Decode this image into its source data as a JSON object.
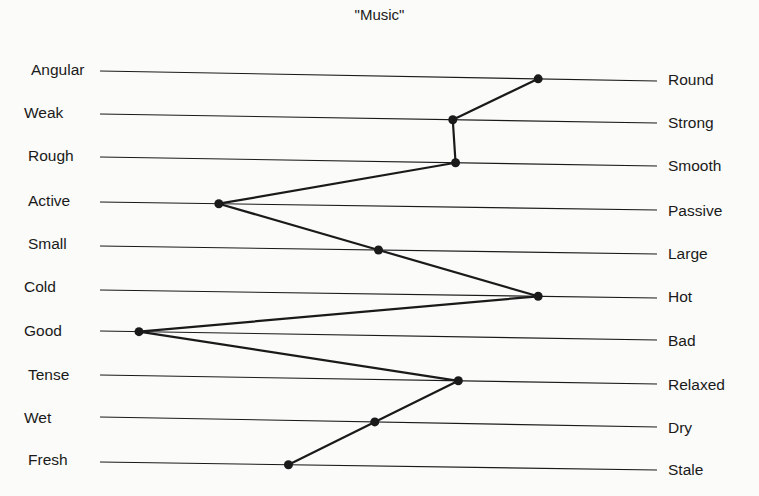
{
  "chart_data": {
    "type": "line",
    "subtype": "semantic-differential-profile",
    "title": "\"Music\"",
    "scale_points": 7,
    "xlim": [
      1,
      7
    ],
    "xlabel": "",
    "ylabel": "",
    "grid": false,
    "legend": null,
    "scales": [
      {
        "left": "Angular",
        "right": "Round",
        "value": 5.72
      },
      {
        "left": "Weak",
        "right": "Strong",
        "value": 4.8
      },
      {
        "left": "Rough",
        "right": "Smooth",
        "value": 4.83
      },
      {
        "left": "Active",
        "right": "Passive",
        "value": 2.28
      },
      {
        "left": "Small",
        "right": "Large",
        "value": 4.0
      },
      {
        "left": "Cold",
        "right": "Hot",
        "value": 5.72
      },
      {
        "left": "Good",
        "right": "Bad",
        "value": 1.42
      },
      {
        "left": "Tense",
        "right": "Relaxed",
        "value": 4.86
      },
      {
        "left": "Wet",
        "right": "Dry",
        "value": 3.96
      },
      {
        "left": "Fresh",
        "right": "Stale",
        "value": 3.03
      }
    ]
  },
  "render": {
    "line_color": "#1a1a1a",
    "profile_color": "#1a1a1a",
    "line_x0": 100,
    "line_x1": 657,
    "rows": [
      {
        "y0": 71,
        "y1": 81,
        "label_y": 61
      },
      {
        "y0": 114,
        "y1": 123,
        "label_y": 104
      },
      {
        "y0": 157,
        "y1": 166,
        "label_y": 147
      },
      {
        "y0": 202,
        "y1": 210,
        "label_y": 192
      },
      {
        "y0": 246,
        "y1": 254,
        "label_y": 235
      },
      {
        "y0": 290,
        "y1": 298,
        "label_y": 278
      },
      {
        "y0": 331,
        "y1": 340,
        "label_y": 322
      },
      {
        "y0": 375,
        "y1": 384,
        "label_y": 366
      },
      {
        "y0": 417,
        "y1": 427,
        "label_y": 409
      },
      {
        "y0": 462,
        "y1": 470,
        "label_y": 451
      }
    ]
  }
}
